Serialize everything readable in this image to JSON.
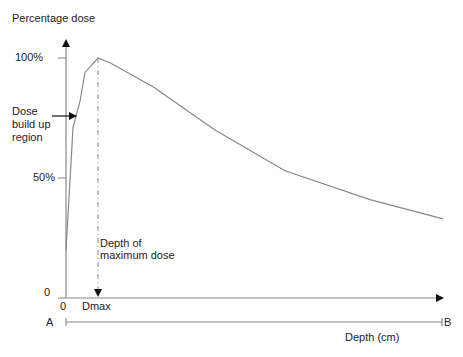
{
  "chart_data": {
    "type": "line",
    "title": "",
    "ylabel": "Percentage dose",
    "xlabel": "Depth (cm)",
    "y_ticks": [
      "0",
      "50%",
      "100%"
    ],
    "x_ticks": [
      "0",
      "Dmax"
    ],
    "ylim": [
      0,
      100
    ],
    "series": [
      {
        "name": "Percentage depth dose",
        "x_px": [
          66,
          70,
          73,
          80,
          85,
          98,
          110,
          153,
          215,
          285,
          370,
          443
        ],
        "values": [
          20,
          49,
          71,
          82,
          94,
          100,
          98,
          88,
          70,
          53,
          41,
          33
        ]
      }
    ],
    "annotations": [
      {
        "text": "Dose build up region",
        "type": "arrow-label"
      },
      {
        "text": "Depth of maximum dose",
        "type": "dashed-line-label"
      }
    ],
    "grid": false,
    "legend": "none"
  },
  "labels": {
    "y_axis_title": "Percentage dose",
    "y_tick_100": "100%",
    "y_tick_50": "50%",
    "y_tick_0": "0",
    "x_tick_0": "0",
    "x_tick_dmax": "Dmax",
    "buildup_line1": "Dose",
    "buildup_line2": "build up",
    "buildup_line3": "region",
    "dmax_line1": "Depth of",
    "dmax_line2": "maximum dose",
    "point_a": "A",
    "point_b": "B",
    "depth_axis": "Depth (cm)"
  },
  "colors": {
    "axis": "#111111",
    "curve": "#888888",
    "dashed": "#888888",
    "text": "#222222"
  }
}
